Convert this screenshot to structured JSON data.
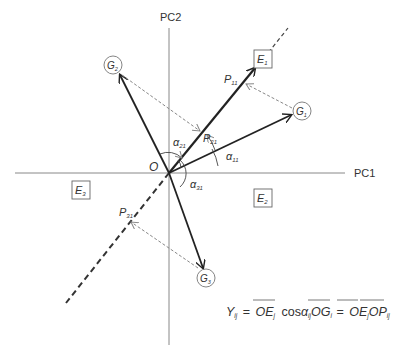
{
  "axes": {
    "x_label": "PC1",
    "y_label": "PC2",
    "origin_label": "O"
  },
  "environments": [
    {
      "id": "E1",
      "main": "E",
      "sub": "1"
    },
    {
      "id": "E2",
      "main": "E",
      "sub": "2"
    },
    {
      "id": "E3",
      "main": "E",
      "sub": "3"
    }
  ],
  "genotypes": [
    {
      "id": "G1",
      "main": "G",
      "sub": "1"
    },
    {
      "id": "G2",
      "main": "G",
      "sub": "2"
    },
    {
      "id": "G3",
      "main": "G",
      "sub": "3"
    }
  ],
  "projections": [
    {
      "id": "P11",
      "main": "P",
      "sub": "11"
    },
    {
      "id": "P21",
      "main": "P",
      "sub": "21"
    },
    {
      "id": "P31",
      "main": "P",
      "sub": "31"
    }
  ],
  "angles": [
    {
      "id": "alpha11",
      "main": "α",
      "sub": "11"
    },
    {
      "id": "alpha21",
      "main": "α",
      "sub": "21"
    },
    {
      "id": "alpha31",
      "main": "α",
      "sub": "31"
    }
  ],
  "formula": {
    "lhs_main": "Y",
    "lhs_sub": "ij",
    "eq1": "=",
    "t1_main": "OE",
    "t1_sub": "j",
    "cos": "cos",
    "alpha": "α",
    "alpha_sub": "ij",
    "t2_main": "OG",
    "t2_sub": "i",
    "eq2": "=",
    "t3_main": "OE",
    "t3_sub": "j",
    "t4_main": "OP",
    "t4_sub": "ij"
  },
  "colors": {
    "axis": "#777777",
    "vector": "#222222",
    "dashed_projection": "#888888",
    "box_border": "#666666"
  }
}
